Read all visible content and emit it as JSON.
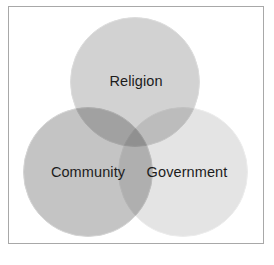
{
  "figure": {
    "type": "venn-diagram",
    "set_count": 3,
    "background_color": "#ffffff",
    "frame": {
      "border_color": "#a8a8a8",
      "fill_color": "#ffffff"
    }
  },
  "chart_data": {
    "type": "venn",
    "title": "",
    "sets": [
      {
        "id": "religion",
        "label": "Religion",
        "position": "top-center",
        "color": "#d2d2d2",
        "outline_color": "#dcdcdc"
      },
      {
        "id": "community",
        "label": "Community",
        "position": "bottom-left",
        "color": "#c4c4c4",
        "outline_color": "#d4d4d4"
      },
      {
        "id": "government",
        "label": "Government",
        "position": "bottom-right",
        "color": "#e4e4e4",
        "outline_color": "#ececec"
      }
    ],
    "overlaps": [
      {
        "sets": [
          "religion",
          "community"
        ],
        "label": ""
      },
      {
        "sets": [
          "religion",
          "government"
        ],
        "label": ""
      },
      {
        "sets": [
          "community",
          "government"
        ],
        "label": ""
      },
      {
        "sets": [
          "religion",
          "community",
          "government"
        ],
        "label": ""
      }
    ],
    "legend": null,
    "label_color": "#1c1c1c"
  }
}
